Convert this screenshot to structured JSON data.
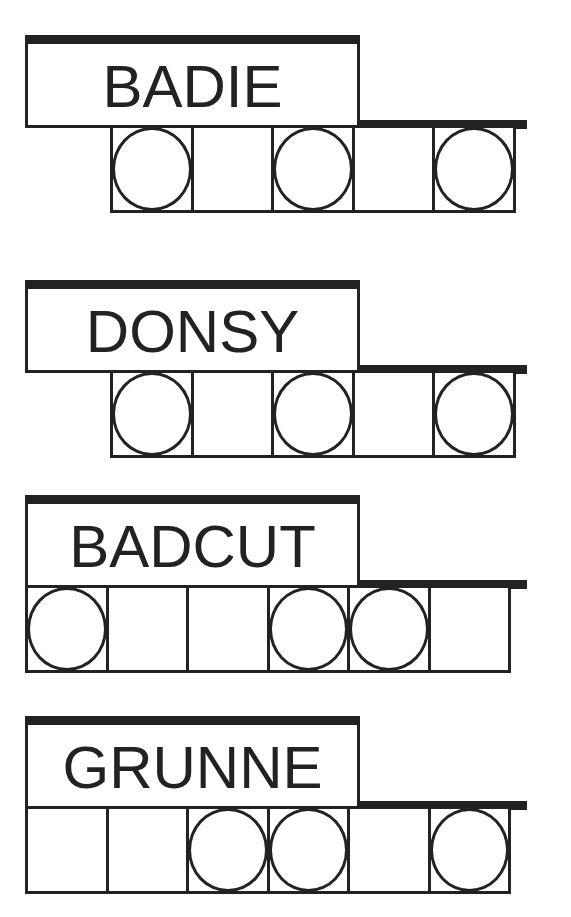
{
  "puzzles": [
    {
      "word": "BADIE",
      "squares": 5,
      "circled": [
        1,
        3,
        5
      ],
      "top": 35,
      "squares_left": 110
    },
    {
      "word": "DONSY",
      "squares": 5,
      "circled": [
        1,
        3,
        5
      ],
      "top": 280,
      "squares_left": 110
    },
    {
      "word": "BADCUT",
      "squares": 6,
      "circled": [
        1,
        4,
        5
      ],
      "top": 495,
      "squares_left": 25
    },
    {
      "word": "GRUNNE",
      "squares": 6,
      "circled": [
        3,
        4,
        6
      ],
      "top": 716,
      "squares_left": 25
    }
  ],
  "colors": {
    "ink": "#222222",
    "paper": "#ffffff"
  }
}
